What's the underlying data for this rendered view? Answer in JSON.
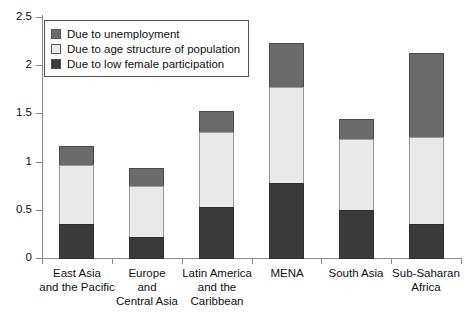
{
  "chart_data": {
    "type": "bar",
    "title": "",
    "subtitle": "",
    "xlabel": "",
    "ylabel": "",
    "ylim": [
      0,
      2.5
    ],
    "yticks": [
      "0",
      "0.5",
      "1",
      "1.5",
      "2",
      "2.5"
    ],
    "ytick_values": [
      0,
      0.5,
      1,
      1.5,
      2,
      2.5
    ],
    "grid": false,
    "stacked": true,
    "legend_position": "top-left",
    "categories": [
      "East Asia and the Pacific",
      "Europe and Central Asia",
      "Latin America and the Caribbean",
      "MENA",
      "South Asia",
      "Sub-Saharan Africa"
    ],
    "category_lines": [
      [
        "East Asia",
        "and the Pacific"
      ],
      [
        "Europe",
        "and",
        "Central Asia"
      ],
      [
        "Latin America",
        "and the",
        "Caribbean"
      ],
      [
        "MENA"
      ],
      [
        "South Asia"
      ],
      [
        "Sub-Saharan",
        "Africa"
      ]
    ],
    "series": [
      {
        "name": "Due to low female participation",
        "color": "#3a3a3a",
        "values": [
          0.36,
          0.23,
          0.54,
          0.79,
          0.51,
          0.36
        ]
      },
      {
        "name": "Due to age structure of population",
        "color": "#e9e9e9",
        "values": [
          0.63,
          0.54,
          0.79,
          1.0,
          0.75,
          0.92
        ]
      },
      {
        "name": "Due to unemployment",
        "color": "#6b6b6b",
        "values": [
          0.2,
          0.19,
          0.23,
          0.47,
          0.21,
          0.88
        ]
      }
    ],
    "cumulative_tops": [
      [
        0.36,
        0.99,
        1.19
      ],
      [
        0.23,
        0.77,
        0.96
      ],
      [
        0.54,
        1.33,
        1.56
      ],
      [
        0.79,
        1.79,
        2.26
      ],
      [
        0.51,
        1.26,
        1.47
      ],
      [
        0.36,
        1.28,
        2.16
      ]
    ],
    "totals": [
      1.19,
      0.96,
      1.56,
      2.26,
      1.47,
      2.16
    ]
  },
  "legend": {
    "items": [
      {
        "label": "Due to unemployment",
        "color": "#6b6b6b"
      },
      {
        "label": "Due to age structure of population",
        "color": "#e9e9e9"
      },
      {
        "label": "Due to low female participation",
        "color": "#3a3a3a"
      }
    ]
  },
  "axis": {
    "y_labels": [
      "2.5",
      "2",
      "1.5",
      "1",
      "0.5",
      "0"
    ]
  }
}
